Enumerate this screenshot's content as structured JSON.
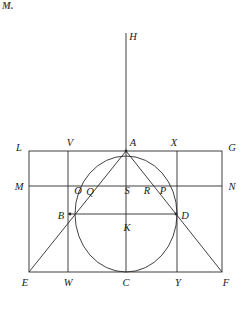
{
  "page": {
    "corner_note": "M.",
    "background_color": "#ffffff",
    "stroke_color": "#2b2b2b",
    "width": 251,
    "height": 312
  },
  "figure": {
    "title": "",
    "labels": [
      {
        "id": "H",
        "text": "H",
        "x": 133,
        "y": 37
      },
      {
        "id": "L",
        "text": "L",
        "x": 19,
        "y": 148
      },
      {
        "id": "V",
        "text": "V",
        "x": 70,
        "y": 143
      },
      {
        "id": "A",
        "text": "A",
        "x": 133,
        "y": 143
      },
      {
        "id": "X",
        "text": "X",
        "x": 174,
        "y": 143
      },
      {
        "id": "G",
        "text": "G",
        "x": 232,
        "y": 148
      },
      {
        "id": "M",
        "text": "M",
        "x": 19,
        "y": 187
      },
      {
        "id": "O",
        "text": "O",
        "x": 78,
        "y": 191
      },
      {
        "id": "Q",
        "text": "Q",
        "x": 90,
        "y": 192
      },
      {
        "id": "S",
        "text": "S",
        "x": 127,
        "y": 191
      },
      {
        "id": "R",
        "text": "R",
        "x": 147,
        "y": 191
      },
      {
        "id": "P",
        "text": "P",
        "x": 163,
        "y": 191
      },
      {
        "id": "N",
        "text": "N",
        "x": 232,
        "y": 187
      },
      {
        "id": "B",
        "text": "B",
        "x": 61,
        "y": 216
      },
      {
        "id": "D",
        "text": "D",
        "x": 185,
        "y": 216
      },
      {
        "id": "K",
        "text": "K",
        "x": 127,
        "y": 228
      },
      {
        "id": "E",
        "text": "E",
        "x": 25,
        "y": 283
      },
      {
        "id": "W",
        "text": "W",
        "x": 68,
        "y": 283
      },
      {
        "id": "C",
        "text": "C",
        "x": 126,
        "y": 283
      },
      {
        "id": "Y",
        "text": "Y",
        "x": 178,
        "y": 283
      },
      {
        "id": "F",
        "text": "F",
        "x": 226,
        "y": 283
      }
    ],
    "points": [
      {
        "id": "A",
        "x": 126,
        "y": 151
      },
      {
        "id": "B",
        "x": 70,
        "y": 214
      },
      {
        "id": "D",
        "x": 176,
        "y": 214
      },
      {
        "id": "C",
        "x": 126,
        "y": 272
      },
      {
        "id": "E",
        "x": 29,
        "y": 272
      },
      {
        "id": "F",
        "x": 222,
        "y": 272
      },
      {
        "id": "K",
        "x": 126,
        "y": 214
      }
    ],
    "rectangle": {
      "left": 29,
      "top": 151,
      "right": 222,
      "bottom": 272
    },
    "ellipse": {
      "cx": 126,
      "cy": 214,
      "rx": 51,
      "ry": 58
    },
    "vertical_axis": {
      "x": 126,
      "y_top": 33,
      "y_bottom": 272
    },
    "vertical_lines_x": [
      68,
      177
    ],
    "horizontal_line_y": 186
  }
}
